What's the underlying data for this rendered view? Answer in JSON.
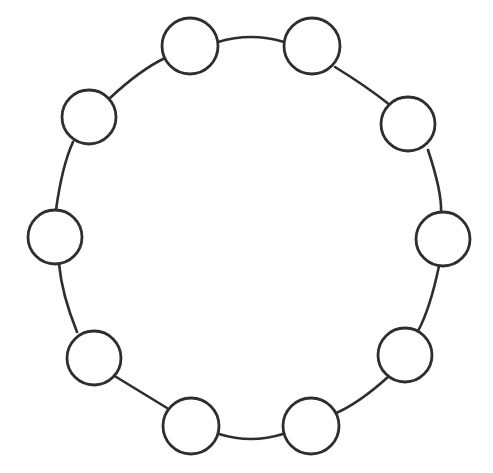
{
  "figure": {
    "background_color": "#ffffff",
    "stroke_color": "#2e2e2e",
    "node_fill_color": "#ffffff",
    "stroke_width": 2.6,
    "node_stroke_width": 2.8,
    "canvas": {
      "width": 493,
      "height": 473
    }
  },
  "chart_data": {
    "type": "diagram",
    "subtitle": "",
    "xlabel": "",
    "ylabel": "",
    "layout": "circular",
    "grid": false,
    "legend": null,
    "annotations": [],
    "graph": {
      "kind": "cycle",
      "node_count": 10,
      "edge_count": 10,
      "degree": 2,
      "node_radius": 27.5,
      "ring_center": {
        "x": 249,
        "y": 236
      },
      "ring_radius": 195,
      "nodes": [
        {
          "id": "n1",
          "label": "",
          "x": 190,
          "y": 46,
          "r": 28
        },
        {
          "id": "n2",
          "label": "",
          "x": 312,
          "y": 46,
          "r": 28
        },
        {
          "id": "n3",
          "label": "",
          "x": 408,
          "y": 124,
          "r": 27
        },
        {
          "id": "n4",
          "label": "",
          "x": 443,
          "y": 239,
          "r": 27
        },
        {
          "id": "n5",
          "label": "",
          "x": 405,
          "y": 355,
          "r": 27
        },
        {
          "id": "n6",
          "label": "",
          "x": 311,
          "y": 426,
          "r": 28
        },
        {
          "id": "n7",
          "label": "",
          "x": 191,
          "y": 426,
          "r": 28
        },
        {
          "id": "n8",
          "label": "",
          "x": 94,
          "y": 358,
          "r": 27
        },
        {
          "id": "n9",
          "label": "",
          "x": 55,
          "y": 237,
          "r": 27
        },
        {
          "id": "n10",
          "label": "",
          "x": 89,
          "y": 117,
          "r": 27
        }
      ],
      "edges": [
        {
          "from": "n1",
          "to": "n2",
          "path": "M 218 42 Q 251 32 284 42"
        },
        {
          "from": "n2",
          "to": "n3",
          "path": "M 335 67 Q 366 86 390 105"
        },
        {
          "from": "n3",
          "to": "n4",
          "path": "M 428 150 Q 442 192 441 212"
        },
        {
          "from": "n4",
          "to": "n5",
          "path": "M 439 266 Q 430 309 418 331"
        },
        {
          "from": "n5",
          "to": "n6",
          "path": "M 388 377 Q 358 404 334 414"
        },
        {
          "from": "n6",
          "to": "n7",
          "path": "M 283 434 Q 251 444 219 434"
        },
        {
          "from": "n7",
          "to": "n8",
          "path": "M 167 408 Q 136 389 113 375"
        },
        {
          "from": "n8",
          "to": "n9",
          "path": "M 77 332 Q 62 295 59 264"
        },
        {
          "from": "n9",
          "to": "n10",
          "path": "M 56 210 Q 62 166 73 142"
        },
        {
          "from": "n10",
          "to": "n1",
          "path": "M 110 98 Q 140 70 165 58"
        }
      ]
    }
  }
}
